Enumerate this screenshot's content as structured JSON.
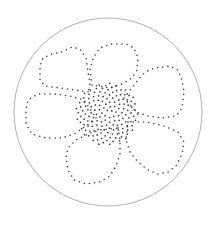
{
  "figure": {
    "background": "#ffffff",
    "dot_color": "#3a3a3a",
    "frame_circle": {
      "cx": 108,
      "cy": 112,
      "r": 94,
      "stroke": "#9a9a9a",
      "stroke_width": 0.8
    },
    "center_spiral": {
      "cx": 107,
      "cy": 114,
      "count": 150,
      "spacing": 2.55,
      "dot_r": 0.85,
      "golden_angle_deg": 137.5
    },
    "petal_dot_r": 0.8,
    "petal_dot_gap": 5.2,
    "petals": [
      {
        "name": "petal-upper-left",
        "points": [
          [
            88,
            92
          ],
          [
            75,
            90
          ],
          [
            60,
            88
          ],
          [
            45,
            86
          ],
          [
            40,
            80
          ],
          [
            40,
            66
          ],
          [
            43,
            58
          ],
          [
            52,
            54
          ],
          [
            62,
            52
          ],
          [
            72,
            47
          ],
          [
            80,
            49
          ],
          [
            86,
            58
          ],
          [
            88,
            72
          ],
          [
            90,
            84
          ]
        ]
      },
      {
        "name": "petal-top",
        "points": [
          [
            92,
            85
          ],
          [
            90,
            70
          ],
          [
            93,
            58
          ],
          [
            100,
            48
          ],
          [
            112,
            44
          ],
          [
            126,
            44
          ],
          [
            134,
            48
          ],
          [
            138,
            58
          ],
          [
            137,
            70
          ],
          [
            132,
            78
          ],
          [
            122,
            84
          ],
          [
            110,
            88
          ]
        ]
      },
      {
        "name": "petal-right",
        "points": [
          [
            124,
            98
          ],
          [
            138,
            80
          ],
          [
            145,
            72
          ],
          [
            155,
            68
          ],
          [
            170,
            66
          ],
          [
            178,
            70
          ],
          [
            182,
            80
          ],
          [
            184,
            92
          ],
          [
            182,
            108
          ],
          [
            176,
            116
          ],
          [
            162,
            118
          ],
          [
            148,
            116
          ],
          [
            136,
            112
          ]
        ]
      },
      {
        "name": "petal-lower-right",
        "points": [
          [
            128,
            122
          ],
          [
            146,
            122
          ],
          [
            164,
            126
          ],
          [
            178,
            132
          ],
          [
            184,
            142
          ],
          [
            182,
            154
          ],
          [
            176,
            166
          ],
          [
            168,
            172
          ],
          [
            158,
            174
          ],
          [
            148,
            170
          ],
          [
            138,
            162
          ],
          [
            130,
            152
          ],
          [
            126,
            140
          ]
        ]
      },
      {
        "name": "petal-bottom",
        "points": [
          [
            118,
            128
          ],
          [
            120,
            140
          ],
          [
            120,
            154
          ],
          [
            116,
            166
          ],
          [
            110,
            176
          ],
          [
            100,
            182
          ],
          [
            86,
            184
          ],
          [
            74,
            180
          ],
          [
            68,
            170
          ],
          [
            66,
            158
          ],
          [
            68,
            148
          ],
          [
            76,
            140
          ],
          [
            88,
            134
          ],
          [
            100,
            130
          ]
        ]
      },
      {
        "name": "petal-left",
        "points": [
          [
            96,
            118
          ],
          [
            86,
            126
          ],
          [
            74,
            134
          ],
          [
            62,
            138
          ],
          [
            46,
            138
          ],
          [
            32,
            134
          ],
          [
            26,
            124
          ],
          [
            26,
            110
          ],
          [
            28,
            100
          ],
          [
            38,
            94
          ],
          [
            54,
            94
          ],
          [
            70,
            96
          ],
          [
            84,
            100
          ]
        ]
      }
    ]
  }
}
